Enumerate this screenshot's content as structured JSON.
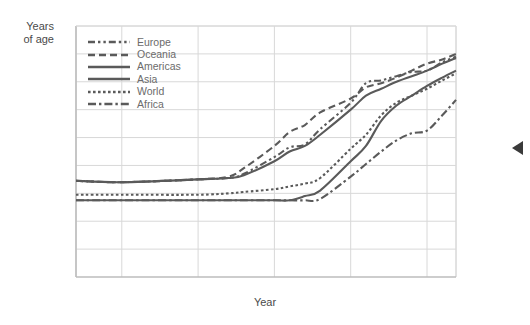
{
  "axes": {
    "ylabel_line1": "Years",
    "ylabel_line2": "of age",
    "xlabel": "Year",
    "yticks": [
      "90",
      "80",
      "70",
      "60",
      "50",
      "40",
      "30",
      "20",
      "10",
      "0"
    ],
    "xticks": [
      "1770",
      "1880",
      "1850",
      "1900",
      "1950",
      "2000",
      "2019"
    ]
  },
  "legend": {
    "items": [
      {
        "label": "Europe",
        "style": "dash-dot-dot"
      },
      {
        "label": "Oceania",
        "style": "dashed"
      },
      {
        "label": "Americas",
        "style": "solid"
      },
      {
        "label": "Asia",
        "style": "solid"
      },
      {
        "label": "World",
        "style": "dotted"
      },
      {
        "label": "Africa",
        "style": "dash-dot"
      }
    ]
  },
  "colors": {
    "line": "#5a5a5a",
    "grid": "#d8d8d8",
    "frame": "#bdbdbd",
    "tick_text": "#8a8a8a",
    "axis_title": "#4a4a4a",
    "marker": "#3a3a3a"
  },
  "marker": {
    "name": "left-pointing-triangle",
    "color": "#3a3a3a"
  },
  "chart_data": {
    "type": "line",
    "title": "",
    "subtitle": "",
    "xlabel": "Year",
    "ylabel": "Years of age",
    "xlim": [
      1770,
      2019
    ],
    "ylim": [
      0,
      90
    ],
    "ytick_values": [
      0,
      10,
      20,
      30,
      40,
      50,
      60,
      70,
      80,
      90
    ],
    "xtick_values": [
      1770,
      1800,
      1850,
      1900,
      1950,
      2000,
      2019
    ],
    "xtick_labels": [
      "1770",
      "1880",
      "1850",
      "1900",
      "1950",
      "2000",
      "2019"
    ],
    "grid": true,
    "legend_position": "top-left-inside",
    "series": [
      {
        "name": "Europe",
        "style": "dash-dot-dot",
        "x": [
          1770,
          1800,
          1850,
          1870,
          1880,
          1900,
          1910,
          1920,
          1930,
          1950,
          1960,
          1970,
          1980,
          1990,
          2000,
          2010,
          2019
        ],
        "y": [
          34.5,
          34.0,
          35.0,
          35.5,
          37.0,
          43.0,
          46.5,
          47.5,
          53.0,
          62.5,
          69.5,
          70.5,
          72.0,
          73.5,
          74.0,
          77.0,
          79.0
        ]
      },
      {
        "name": "Oceania",
        "style": "dashed",
        "x": [
          1770,
          1800,
          1850,
          1870,
          1880,
          1900,
          1910,
          1920,
          1930,
          1950,
          1960,
          1970,
          1980,
          1990,
          2000,
          2010,
          2019
        ],
        "y": [
          34.5,
          34.0,
          35.0,
          36.0,
          39.0,
          47.0,
          52.0,
          54.5,
          59.0,
          64.0,
          68.0,
          69.5,
          71.5,
          74.0,
          76.5,
          78.0,
          80.0
        ]
      },
      {
        "name": "Americas",
        "style": "solid",
        "x": [
          1770,
          1800,
          1850,
          1870,
          1880,
          1900,
          1910,
          1920,
          1930,
          1950,
          1960,
          1970,
          1980,
          1990,
          2000,
          2010,
          2019
        ],
        "y": [
          34.5,
          34.0,
          35.0,
          35.5,
          36.5,
          41.5,
          45.0,
          47.0,
          51.0,
          60.0,
          65.0,
          67.5,
          70.0,
          72.0,
          74.0,
          76.5,
          78.5
        ]
      },
      {
        "name": "Asia",
        "style": "solid",
        "x": [
          1770,
          1800,
          1850,
          1870,
          1880,
          1900,
          1910,
          1920,
          1930,
          1950,
          1960,
          1970,
          1980,
          1990,
          2000,
          2010,
          2019
        ],
        "y": [
          27.5,
          27.5,
          27.5,
          27.5,
          27.5,
          27.5,
          27.5,
          29.0,
          31.0,
          41.5,
          47.0,
          56.0,
          61.5,
          65.0,
          68.5,
          71.5,
          74.0
        ]
      },
      {
        "name": "World",
        "style": "dotted",
        "x": [
          1770,
          1800,
          1850,
          1870,
          1880,
          1900,
          1910,
          1920,
          1930,
          1950,
          1960,
          1970,
          1980,
          1990,
          2000,
          2010,
          2019
        ],
        "y": [
          29.5,
          29.5,
          29.5,
          30.0,
          30.5,
          31.5,
          32.5,
          33.5,
          35.5,
          46.0,
          51.0,
          58.0,
          62.5,
          65.0,
          67.5,
          70.5,
          73.0
        ]
      },
      {
        "name": "Africa",
        "style": "dash-dot",
        "x": [
          1770,
          1800,
          1850,
          1870,
          1880,
          1900,
          1910,
          1920,
          1930,
          1950,
          1960,
          1970,
          1980,
          1990,
          2000,
          2010,
          2019
        ],
        "y": [
          27.5,
          27.5,
          27.5,
          27.5,
          27.5,
          27.5,
          27.5,
          27.5,
          28.0,
          36.0,
          40.5,
          45.0,
          49.0,
          51.5,
          52.5,
          58.0,
          63.5
        ]
      }
    ]
  }
}
